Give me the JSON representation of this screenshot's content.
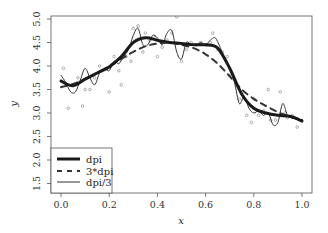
{
  "chart_data": {
    "type": "line",
    "title": "",
    "xlabel": "x",
    "ylabel": "y",
    "xlim": [
      -0.04,
      1.04
    ],
    "ylim": [
      1.4,
      5.08
    ],
    "xticks": [
      0.0,
      0.2,
      0.4,
      0.6,
      0.8,
      1.0
    ],
    "xtick_labels": [
      "0.0",
      "0.2",
      "0.4",
      "0.6",
      "0.8",
      "1.0"
    ],
    "yticks": [
      1.5,
      2.0,
      2.5,
      3.0,
      3.5,
      4.0,
      4.5,
      5.0
    ],
    "ytick_labels": [
      "1.5",
      "2.0",
      "2.5",
      "3.0",
      "3.5",
      "4.0",
      "4.5",
      "5.0"
    ],
    "grid": false,
    "legend_position": "bottom-left",
    "scatter": {
      "name": "observations",
      "color": "#999999",
      "x": [
        0.01,
        0.03,
        0.05,
        0.07,
        0.09,
        0.1,
        0.12,
        0.14,
        0.16,
        0.17,
        0.19,
        0.2,
        0.22,
        0.24,
        0.25,
        0.27,
        0.29,
        0.3,
        0.32,
        0.34,
        0.35,
        0.37,
        0.39,
        0.4,
        0.42,
        0.44,
        0.46,
        0.48,
        0.5,
        0.52,
        0.54,
        0.56,
        0.58,
        0.6,
        0.62,
        0.63,
        0.65,
        0.67,
        0.69,
        0.7,
        0.72,
        0.74,
        0.75,
        0.77,
        0.79,
        0.8,
        0.82,
        0.84,
        0.86,
        0.87,
        0.89,
        0.91,
        0.93,
        0.94,
        0.96,
        0.98
      ],
      "y": [
        3.95,
        3.1,
        3.6,
        3.75,
        3.15,
        3.5,
        3.5,
        3.75,
        4.0,
        3.9,
        3.95,
        3.45,
        4.2,
        3.9,
        3.6,
        4.2,
        4.1,
        4.8,
        4.85,
        4.3,
        4.7,
        4.55,
        4.6,
        4.2,
        4.4,
        4.55,
        4.7,
        5.05,
        4.1,
        4.35,
        4.5,
        4.45,
        4.5,
        4.45,
        4.5,
        4.7,
        4.35,
        4.3,
        4.2,
        3.8,
        3.7,
        3.3,
        3.4,
        2.95,
        2.8,
        3.3,
        2.95,
        3.05,
        3.5,
        2.85,
        2.85,
        3.45,
        3.0,
        2.9,
        2.95,
        2.7
      ]
    },
    "series": [
      {
        "name": "dpi",
        "style": "solid",
        "width": 3,
        "color": "#1a1a1a",
        "x": [
          0.0,
          0.05,
          0.1,
          0.15,
          0.2,
          0.25,
          0.3,
          0.35,
          0.4,
          0.45,
          0.5,
          0.55,
          0.6,
          0.65,
          0.7,
          0.75,
          0.8,
          0.85,
          0.9,
          0.95,
          1.0
        ],
        "values": [
          3.68,
          3.58,
          3.72,
          3.85,
          3.98,
          4.2,
          4.5,
          4.6,
          4.55,
          4.5,
          4.48,
          4.45,
          4.45,
          4.38,
          3.95,
          3.4,
          3.1,
          3.0,
          2.95,
          2.93,
          2.83
        ]
      },
      {
        "name": "3*dpi",
        "style": "dashed",
        "width": 2,
        "color": "#333333",
        "x": [
          0.0,
          0.05,
          0.1,
          0.15,
          0.2,
          0.25,
          0.3,
          0.35,
          0.4,
          0.45,
          0.5,
          0.55,
          0.6,
          0.65,
          0.7,
          0.75,
          0.8,
          0.85,
          0.9,
          0.95,
          1.0
        ],
        "values": [
          3.55,
          3.62,
          3.72,
          3.85,
          4.0,
          4.15,
          4.3,
          4.42,
          4.48,
          4.5,
          4.45,
          4.38,
          4.25,
          4.05,
          3.78,
          3.5,
          3.3,
          3.15,
          3.02,
          2.92,
          2.85
        ]
      },
      {
        "name": "dpi/3",
        "style": "solid",
        "width": 1,
        "color": "#333333",
        "x": [
          0.0,
          0.02,
          0.04,
          0.06,
          0.08,
          0.1,
          0.12,
          0.14,
          0.16,
          0.18,
          0.2,
          0.22,
          0.24,
          0.26,
          0.28,
          0.3,
          0.32,
          0.34,
          0.36,
          0.38,
          0.4,
          0.42,
          0.44,
          0.46,
          0.48,
          0.5,
          0.52,
          0.54,
          0.56,
          0.58,
          0.6,
          0.62,
          0.64,
          0.66,
          0.68,
          0.7,
          0.72,
          0.74,
          0.76,
          0.78,
          0.8,
          0.82,
          0.84,
          0.86,
          0.88,
          0.9,
          0.92,
          0.94,
          0.96,
          0.98,
          1.0
        ],
        "values": [
          3.8,
          3.65,
          3.45,
          3.45,
          3.7,
          3.95,
          3.75,
          3.6,
          3.85,
          3.95,
          3.9,
          4.1,
          4.05,
          4.2,
          4.35,
          4.65,
          4.8,
          4.45,
          4.45,
          4.65,
          4.6,
          4.45,
          4.7,
          4.75,
          4.3,
          4.15,
          4.5,
          4.45,
          4.45,
          4.5,
          4.45,
          4.55,
          4.6,
          4.4,
          4.15,
          3.95,
          3.65,
          3.2,
          3.35,
          3.1,
          3.0,
          3.05,
          2.95,
          3.0,
          2.75,
          2.8,
          3.2,
          2.95,
          2.9,
          2.9,
          2.8
        ]
      }
    ],
    "legend": [
      {
        "label": "dpi",
        "style": "thick-solid"
      },
      {
        "label": "3*dpi",
        "style": "dashed"
      },
      {
        "label": "dpi/3",
        "style": "thin-solid"
      }
    ]
  }
}
